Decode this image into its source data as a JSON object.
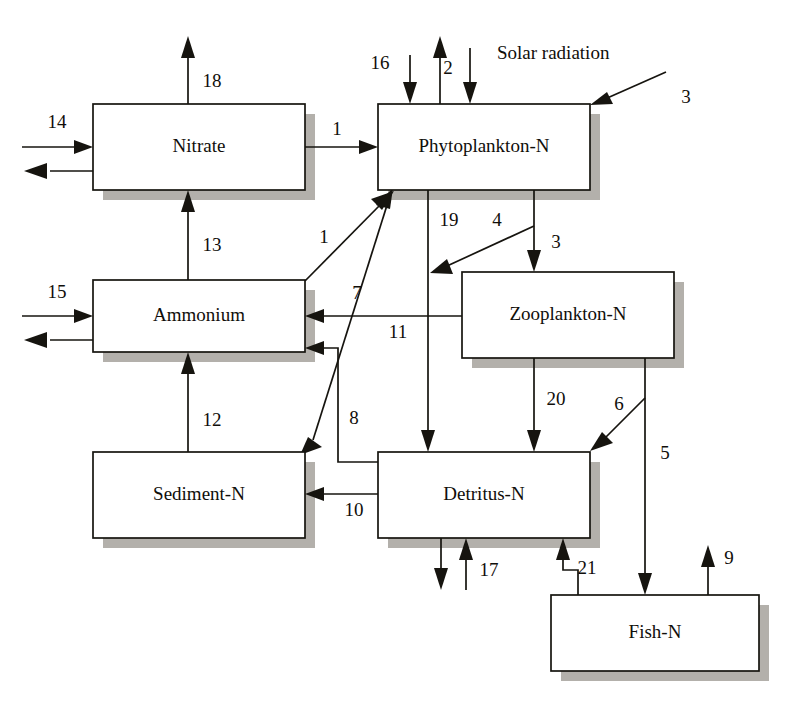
{
  "diagram": {
    "annotation_solar": "Solar radiation",
    "colors": {
      "line": "#16140f",
      "box_fill": "#ffffff",
      "box_stroke": "#16140f",
      "shadow": "#b3b0ab",
      "background": "#ffffff"
    },
    "boxes": [
      {
        "id": "nitrate",
        "label": "Nitrate",
        "x": 93,
        "y": 104,
        "w": 212,
        "h": 86
      },
      {
        "id": "phytoplankton",
        "label": "Phytoplankton-N",
        "x": 378,
        "y": 104,
        "w": 212,
        "h": 86
      },
      {
        "id": "ammonium",
        "label": "Ammonium",
        "x": 93,
        "y": 280,
        "w": 212,
        "h": 72
      },
      {
        "id": "zooplankton",
        "label": "Zooplankton-N",
        "x": 462,
        "y": 272,
        "w": 212,
        "h": 86
      },
      {
        "id": "sediment",
        "label": "Sediment-N",
        "x": 93,
        "y": 452,
        "w": 212,
        "h": 86
      },
      {
        "id": "detritus",
        "label": "Detritus-N",
        "x": 378,
        "y": 452,
        "w": 212,
        "h": 86
      },
      {
        "id": "fish",
        "label": "Fish-N",
        "x": 551,
        "y": 595,
        "w": 208,
        "h": 76
      }
    ],
    "flows": [
      {
        "id": "f1-nitrate-phyto",
        "label": "1",
        "from": "nitrate",
        "to": "phytoplankton"
      },
      {
        "id": "f1-ammonium-phyto",
        "label": "1",
        "from": "ammonium",
        "to": "phytoplankton"
      },
      {
        "id": "f2-solar-phyto",
        "label": "2",
        "from": "external",
        "to": "phytoplankton"
      },
      {
        "id": "f3-external-phyto",
        "label": "3",
        "from": "external",
        "to": "phytoplankton"
      },
      {
        "id": "f4-phyto-zoo",
        "label": "4",
        "from": "phytoplankton",
        "to": "zooplankton"
      },
      {
        "id": "f5-phyto-detritus",
        "label": "5",
        "from": "phytoplankton",
        "to": "detritus"
      },
      {
        "id": "f6-zoo-fish",
        "label": "6",
        "from": "zooplankton",
        "to": "fish"
      },
      {
        "id": "f7-zoo-detritus",
        "label": "7",
        "from": "zooplankton",
        "to": "detritus"
      },
      {
        "id": "f8-detritus-phyto",
        "label": "8",
        "from": "detritus",
        "to": "phytoplankton"
      },
      {
        "id": "f9-detritus-ammonium",
        "label": "9",
        "from": "detritus",
        "to": "ammonium"
      },
      {
        "id": "f10-fish-external",
        "label": "10",
        "from": "fish",
        "to": "external"
      },
      {
        "id": "f11-detritus-sediment",
        "label": "11",
        "from": "detritus",
        "to": "sediment"
      },
      {
        "id": "f12-zoo-ammonium",
        "label": "12",
        "from": "zooplankton",
        "to": "ammonium"
      },
      {
        "id": "f13-sediment-ammonium",
        "label": "13",
        "from": "sediment",
        "to": "ammonium"
      },
      {
        "id": "f14-ammonium-nitrate",
        "label": "14",
        "from": "ammonium",
        "to": "nitrate"
      },
      {
        "id": "f15-external-nitrate",
        "label": "15",
        "from": "external",
        "to": "nitrate"
      },
      {
        "id": "f16-external-ammonium",
        "label": "16",
        "from": "external",
        "to": "ammonium"
      },
      {
        "id": "f17-external-phyto",
        "label": "17",
        "from": "external",
        "to": "phytoplankton"
      },
      {
        "id": "f18-external-detritus",
        "label": "18",
        "from": "external",
        "to": "detritus"
      },
      {
        "id": "f19-nitrate-external",
        "label": "19",
        "from": "nitrate",
        "to": "external"
      },
      {
        "id": "f20-phyto-detritus",
        "label": "20",
        "from": "phytoplankton",
        "to": "detritus"
      },
      {
        "id": "f21-zoo-detritus",
        "label": "21",
        "from": "zooplankton",
        "to": "detritus"
      },
      {
        "id": "f22-fish-detritus",
        "label": "22",
        "from": "fish",
        "to": "detritus"
      }
    ]
  }
}
